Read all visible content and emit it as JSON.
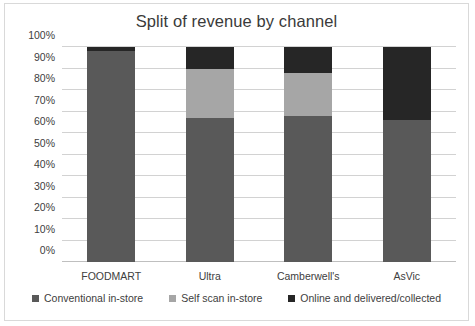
{
  "chart_data": {
    "type": "bar",
    "subtype": "stacked-100",
    "title": "Split of revenue by channel",
    "xlabel": "",
    "ylabel": "",
    "categories": [
      "FOODMART",
      "Ultra",
      "Camberwell's",
      "AsVic"
    ],
    "series": [
      {
        "name": "Conventional in-store",
        "color": "#595959",
        "values": [
          98,
          67,
          68,
          66
        ]
      },
      {
        "name": "Self scan in-store",
        "color": "#a6a6a6",
        "values": [
          0,
          23,
          20,
          0
        ]
      },
      {
        "name": "Online and delivered/collected",
        "color": "#262626",
        "values": [
          2,
          10,
          12,
          34
        ]
      }
    ],
    "ylim": [
      0,
      100
    ],
    "yticks": [
      "0%",
      "10%",
      "20%",
      "30%",
      "40%",
      "50%",
      "60%",
      "70%",
      "80%",
      "90%",
      "100%"
    ],
    "ytick_values": [
      0,
      10,
      20,
      30,
      40,
      50,
      60,
      70,
      80,
      90,
      100
    ],
    "grid": true,
    "legend_position": "bottom"
  },
  "colors": {
    "gridline": "#d2d2d2",
    "axis": "#bfbfbf",
    "text": "#404040",
    "title": "#3a3a3a",
    "border": "#d9d9d9",
    "background": "#ffffff"
  }
}
